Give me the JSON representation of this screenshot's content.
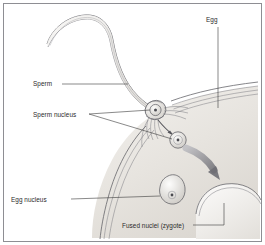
{
  "figure": {
    "frame_color": "#8e8e93",
    "background_color": "#ffffff",
    "line_color": "#5d5d63",
    "label_color": "#2b2b2b",
    "arrow_color": "#8a8a90",
    "cytoplasm_color": "#e9e6e1"
  },
  "labels": {
    "egg": "Egg",
    "sperm": "Sperm",
    "sperm_nucleus": "Sperm nucleus",
    "egg_nucleus": "Egg nucleus",
    "fused_nuclei": "Fused nuclei (zygote)"
  },
  "structures": [
    {
      "name": "sperm-tail",
      "description": "long curved flagellum sweeping from upper left"
    },
    {
      "name": "sperm-head",
      "description": "oval head containing sperm nucleus at egg surface"
    },
    {
      "name": "sperm-nucleus-in-head",
      "description": "small dark dot inside sperm head"
    },
    {
      "name": "released-sperm-nucleus",
      "description": "round nucleus released inside the egg"
    },
    {
      "name": "egg-membrane",
      "description": "multi-layered curved membrane of the egg"
    },
    {
      "name": "egg-cytoplasm",
      "description": "shaded interior of egg cell"
    },
    {
      "name": "egg-nucleus",
      "description": "pear-shaped nucleus in lower middle of egg"
    },
    {
      "name": "migration-arrow",
      "description": "thick grey curved arrow showing nucleus movement toward zygote"
    },
    {
      "name": "zygote-cell",
      "description": "cell at lower right with fused nuclei"
    }
  ]
}
